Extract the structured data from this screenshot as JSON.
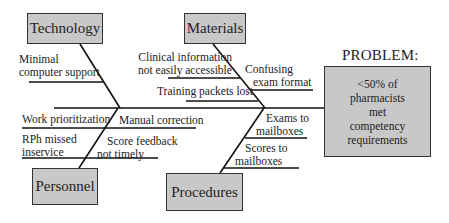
{
  "diagram": {
    "type": "fishbone",
    "problem": {
      "heading": "PROBLEM:",
      "lines": [
        "<50% of",
        "pharmacists",
        "met",
        "competency",
        "requirements"
      ]
    },
    "categories": {
      "technology": {
        "label": "Technology",
        "causes": [
          {
            "lines": [
              "Minimal",
              "computer support"
            ]
          }
        ]
      },
      "materials": {
        "label": "Materials",
        "causes": [
          {
            "lines": [
              "Clinical information",
              "not easily accessible"
            ]
          },
          {
            "lines": [
              "Confusing",
              "exam format"
            ]
          },
          {
            "lines": [
              "Training packets lost"
            ]
          }
        ]
      },
      "personnel": {
        "label": "Personnel",
        "causes": [
          {
            "lines": [
              "Work prioritization"
            ]
          },
          {
            "lines": [
              "Manual correction"
            ]
          },
          {
            "lines": [
              "RPh missed",
              "inservice"
            ]
          },
          {
            "lines": [
              "Score feedback",
              "not timely"
            ]
          }
        ]
      },
      "procedures": {
        "label": "Procedures",
        "causes": [
          {
            "lines": [
              "Exams to",
              "mailboxes"
            ]
          },
          {
            "lines": [
              "Scores to",
              "mailboxes"
            ]
          }
        ]
      }
    }
  }
}
